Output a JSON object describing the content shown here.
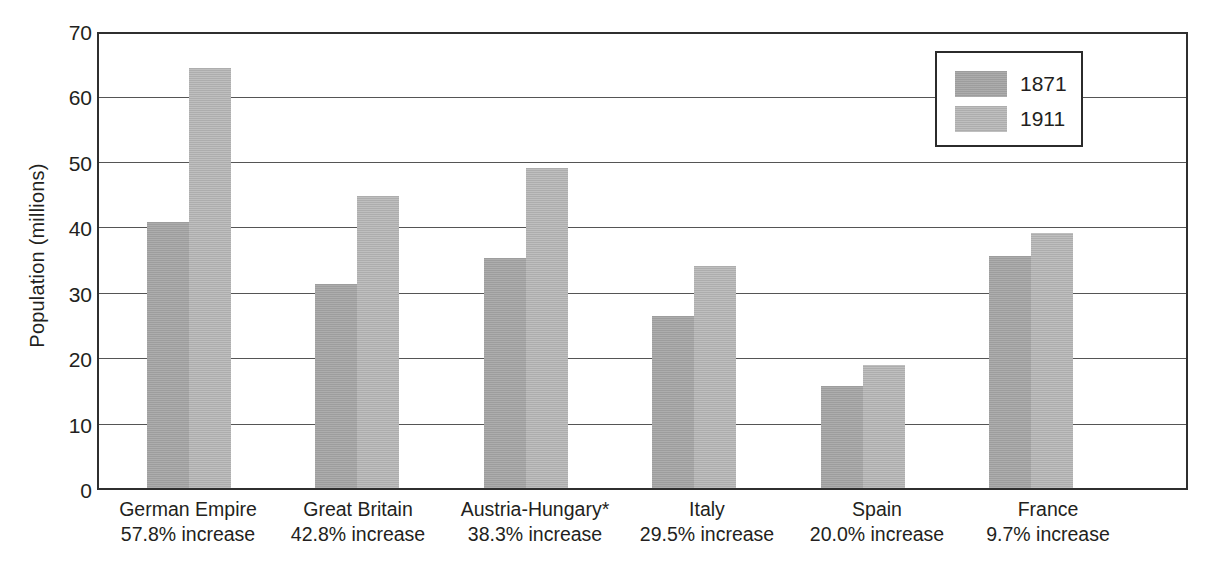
{
  "chart_data": {
    "type": "bar",
    "title": "",
    "xlabel": "",
    "ylabel": "Population (millions)",
    "ylim": [
      0,
      70
    ],
    "ytick_step": 10,
    "yticks": [
      70,
      60,
      50,
      40,
      30,
      20,
      10,
      0
    ],
    "grid": true,
    "legend_position": "top-right",
    "categories": [
      "German Empire",
      "Great Britain",
      "Austria-Hungary*",
      "Italy",
      "Spain",
      "France"
    ],
    "category_sublabels": [
      "57.8% increase",
      "42.8% increase",
      "38.3% increase",
      "29.5% increase",
      "20.0% increase",
      "9.7% increase"
    ],
    "series": [
      {
        "name": "1871",
        "color": "#9d9d9d",
        "values": [
          41.0,
          31.4,
          35.5,
          26.5,
          15.7,
          35.8
        ]
      },
      {
        "name": "1911",
        "color": "#adadad",
        "values": [
          64.7,
          45.1,
          49.3,
          34.3,
          18.9,
          39.3
        ]
      }
    ]
  },
  "axis": {
    "y_title": "Population (millions)",
    "y_tick_labels": [
      "70",
      "60",
      "50",
      "40",
      "30",
      "20",
      "10",
      "0"
    ]
  },
  "legend": {
    "entries": [
      {
        "label": "1871"
      },
      {
        "label": "1911"
      }
    ]
  },
  "categories": [
    {
      "name": "German Empire",
      "sub": "57.8% increase"
    },
    {
      "name": "Great Britain",
      "sub": "42.8% increase"
    },
    {
      "name": "Austria-Hungary*",
      "sub": "38.3% increase"
    },
    {
      "name": "Italy",
      "sub": "29.5% increase"
    },
    {
      "name": "Spain",
      "sub": "20.0% increase"
    },
    {
      "name": "France",
      "sub": "9.7% increase"
    }
  ],
  "colors": {
    "series_1871": "#9d9d9d",
    "series_1911": "#adadad",
    "axis": "#2f2f2f",
    "gridline": "#555555",
    "text": "#231f20",
    "background": "#ffffff"
  }
}
